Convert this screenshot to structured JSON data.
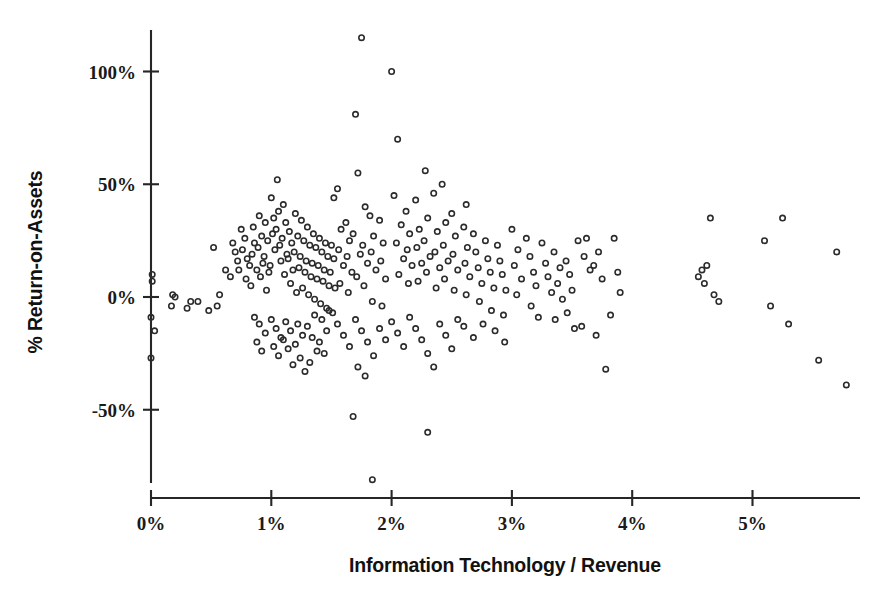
{
  "chart_data": {
    "type": "scatter",
    "title": "",
    "xlabel": "Information Technology / Revenue",
    "ylabel": "% Return-on-Assets",
    "xlim": [
      0,
      5.92
    ],
    "ylim": [
      -95,
      125
    ],
    "grid": false,
    "legend": null,
    "marker_style": "open-circle",
    "xticks": [
      0,
      1,
      2,
      3,
      4,
      5
    ],
    "xtick_labels": [
      "0%",
      "1%",
      "2%",
      "3%",
      "4%",
      "5%"
    ],
    "yticks": [
      -50,
      0,
      50,
      100
    ],
    "ytick_labels": [
      "-50%",
      "0%",
      "50%",
      "100%"
    ],
    "n_points": 268,
    "points": [
      [
        0.01,
        10
      ],
      [
        0.01,
        7
      ],
      [
        0.0,
        -9
      ],
      [
        0.0,
        -27
      ],
      [
        0.03,
        -15
      ],
      [
        0.18,
        1
      ],
      [
        0.2,
        0
      ],
      [
        0.17,
        -4
      ],
      [
        0.3,
        -5
      ],
      [
        0.33,
        -2
      ],
      [
        0.39,
        -2
      ],
      [
        0.52,
        22
      ],
      [
        0.62,
        12
      ],
      [
        0.57,
        1
      ],
      [
        0.68,
        24
      ],
      [
        0.7,
        20
      ],
      [
        0.72,
        16
      ],
      [
        0.73,
        12
      ],
      [
        0.66,
        9
      ],
      [
        0.75,
        30
      ],
      [
        0.78,
        26
      ],
      [
        0.76,
        21
      ],
      [
        0.8,
        17
      ],
      [
        0.82,
        14
      ],
      [
        0.79,
        8
      ],
      [
        0.85,
        31
      ],
      [
        0.86,
        24
      ],
      [
        0.84,
        19
      ],
      [
        0.88,
        12
      ],
      [
        0.83,
        5
      ],
      [
        0.9,
        36
      ],
      [
        0.92,
        27
      ],
      [
        0.89,
        22
      ],
      [
        0.93,
        15
      ],
      [
        0.91,
        9
      ],
      [
        0.95,
        33
      ],
      [
        0.97,
        25
      ],
      [
        0.94,
        18
      ],
      [
        0.98,
        11
      ],
      [
        0.96,
        3
      ],
      [
        1.0,
        44
      ],
      [
        1.02,
        35
      ],
      [
        1.01,
        28
      ],
      [
        1.03,
        21
      ],
      [
        0.99,
        14
      ],
      [
        1.05,
        52
      ],
      [
        1.06,
        38
      ],
      [
        1.04,
        30
      ],
      [
        1.07,
        23
      ],
      [
        1.08,
        16
      ],
      [
        1.1,
        41
      ],
      [
        1.12,
        33
      ],
      [
        1.09,
        26
      ],
      [
        1.13,
        19
      ],
      [
        1.11,
        10
      ],
      [
        1.15,
        29
      ],
      [
        1.17,
        24
      ],
      [
        1.14,
        17
      ],
      [
        1.18,
        12
      ],
      [
        1.16,
        6
      ],
      [
        1.2,
        37
      ],
      [
        1.22,
        27
      ],
      [
        1.19,
        20
      ],
      [
        1.23,
        13
      ],
      [
        1.21,
        2
      ],
      [
        1.25,
        34
      ],
      [
        1.27,
        25
      ],
      [
        1.24,
        18
      ],
      [
        1.28,
        11
      ],
      [
        1.26,
        4
      ],
      [
        1.3,
        31
      ],
      [
        1.32,
        23
      ],
      [
        1.29,
        16
      ],
      [
        1.33,
        9
      ],
      [
        1.31,
        1
      ],
      [
        1.35,
        28
      ],
      [
        1.37,
        22
      ],
      [
        1.34,
        15
      ],
      [
        1.38,
        8
      ],
      [
        1.36,
        -1
      ],
      [
        1.4,
        26
      ],
      [
        1.42,
        20
      ],
      [
        1.39,
        14
      ],
      [
        1.43,
        7
      ],
      [
        1.41,
        -3
      ],
      [
        1.45,
        24
      ],
      [
        1.47,
        18
      ],
      [
        1.44,
        12
      ],
      [
        1.48,
        5
      ],
      [
        1.46,
        -5
      ],
      [
        1.5,
        23
      ],
      [
        1.52,
        17
      ],
      [
        1.49,
        11
      ],
      [
        1.53,
        4
      ],
      [
        1.51,
        -7
      ],
      [
        0.86,
        -9
      ],
      [
        0.9,
        -12
      ],
      [
        0.95,
        -16
      ],
      [
        0.88,
        -20
      ],
      [
        0.92,
        -24
      ],
      [
        1.0,
        -10
      ],
      [
        1.04,
        -14
      ],
      [
        1.08,
        -18
      ],
      [
        1.02,
        -22
      ],
      [
        1.06,
        -26
      ],
      [
        1.12,
        -11
      ],
      [
        1.16,
        -15
      ],
      [
        1.1,
        -19
      ],
      [
        1.14,
        -23
      ],
      [
        1.18,
        -30
      ],
      [
        1.22,
        -12
      ],
      [
        1.26,
        -17
      ],
      [
        1.2,
        -21
      ],
      [
        1.24,
        -27
      ],
      [
        1.28,
        -33
      ],
      [
        1.3,
        -13
      ],
      [
        1.34,
        -18
      ],
      [
        1.38,
        -24
      ],
      [
        1.32,
        -29
      ],
      [
        1.36,
        -8
      ],
      [
        1.42,
        -10
      ],
      [
        1.46,
        -15
      ],
      [
        1.4,
        -20
      ],
      [
        1.44,
        -25
      ],
      [
        1.48,
        -6
      ],
      [
        1.55,
        48
      ],
      [
        1.58,
        30
      ],
      [
        1.56,
        21
      ],
      [
        1.6,
        14
      ],
      [
        1.57,
        6
      ],
      [
        1.62,
        33
      ],
      [
        1.65,
        25
      ],
      [
        1.63,
        18
      ],
      [
        1.67,
        11
      ],
      [
        1.64,
        2
      ],
      [
        1.7,
        81
      ],
      [
        1.72,
        55
      ],
      [
        1.68,
        28
      ],
      [
        1.74,
        19
      ],
      [
        1.71,
        9
      ],
      [
        1.75,
        115
      ],
      [
        1.78,
        40
      ],
      [
        1.76,
        23
      ],
      [
        1.8,
        15
      ],
      [
        1.77,
        5
      ],
      [
        1.82,
        36
      ],
      [
        1.85,
        27
      ],
      [
        1.83,
        20
      ],
      [
        1.87,
        12
      ],
      [
        1.84,
        -2
      ],
      [
        1.9,
        34
      ],
      [
        1.93,
        24
      ],
      [
        1.91,
        16
      ],
      [
        1.95,
        8
      ],
      [
        1.92,
        -4
      ],
      [
        1.55,
        -12
      ],
      [
        1.6,
        -17
      ],
      [
        1.65,
        -22
      ],
      [
        1.7,
        -10
      ],
      [
        1.75,
        -15
      ],
      [
        1.8,
        -20
      ],
      [
        1.85,
        -26
      ],
      [
        1.9,
        -14
      ],
      [
        1.95,
        -19
      ],
      [
        1.72,
        -31
      ],
      [
        1.78,
        -35
      ],
      [
        1.68,
        -53
      ],
      [
        1.84,
        -81
      ],
      [
        2.0,
        100
      ],
      [
        2.05,
        70
      ],
      [
        2.02,
        45
      ],
      [
        2.08,
        32
      ],
      [
        2.04,
        24
      ],
      [
        2.1,
        17
      ],
      [
        2.06,
        10
      ],
      [
        2.12,
        38
      ],
      [
        2.15,
        28
      ],
      [
        2.13,
        21
      ],
      [
        2.17,
        14
      ],
      [
        2.14,
        6
      ],
      [
        2.2,
        43
      ],
      [
        2.23,
        30
      ],
      [
        2.21,
        22
      ],
      [
        2.25,
        15
      ],
      [
        2.22,
        7
      ],
      [
        2.28,
        56
      ],
      [
        2.3,
        35
      ],
      [
        2.27,
        25
      ],
      [
        2.32,
        18
      ],
      [
        2.29,
        11
      ],
      [
        2.35,
        46
      ],
      [
        2.38,
        29
      ],
      [
        2.36,
        20
      ],
      [
        2.4,
        13
      ],
      [
        2.37,
        4
      ],
      [
        2.42,
        50
      ],
      [
        2.45,
        33
      ],
      [
        2.43,
        23
      ],
      [
        2.47,
        16
      ],
      [
        2.44,
        8
      ],
      [
        2.5,
        37
      ],
      [
        2.53,
        27
      ],
      [
        2.51,
        19
      ],
      [
        2.55,
        12
      ],
      [
        2.52,
        3
      ],
      [
        2.0,
        -11
      ],
      [
        2.05,
        -16
      ],
      [
        2.1,
        -22
      ],
      [
        2.15,
        -9
      ],
      [
        2.2,
        -14
      ],
      [
        2.25,
        -19
      ],
      [
        2.3,
        -25
      ],
      [
        2.35,
        -31
      ],
      [
        2.4,
        -12
      ],
      [
        2.45,
        -17
      ],
      [
        2.5,
        -23
      ],
      [
        2.55,
        -10
      ],
      [
        2.3,
        -60
      ],
      [
        2.6,
        31
      ],
      [
        2.63,
        22
      ],
      [
        2.61,
        15
      ],
      [
        2.65,
        9
      ],
      [
        2.62,
        1
      ],
      [
        2.68,
        28
      ],
      [
        2.7,
        20
      ],
      [
        2.72,
        13
      ],
      [
        2.75,
        6
      ],
      [
        2.73,
        -2
      ],
      [
        2.78,
        25
      ],
      [
        2.8,
        17
      ],
      [
        2.82,
        11
      ],
      [
        2.85,
        4
      ],
      [
        2.83,
        -6
      ],
      [
        2.88,
        23
      ],
      [
        2.9,
        16
      ],
      [
        2.92,
        10
      ],
      [
        2.95,
        3
      ],
      [
        2.93,
        -8
      ],
      [
        2.6,
        -13
      ],
      [
        2.68,
        -18
      ],
      [
        2.76,
        -12
      ],
      [
        2.86,
        -15
      ],
      [
        2.94,
        -20
      ],
      [
        3.0,
        30
      ],
      [
        3.05,
        21
      ],
      [
        3.02,
        14
      ],
      [
        3.08,
        8
      ],
      [
        3.04,
        1
      ],
      [
        3.12,
        26
      ],
      [
        3.15,
        18
      ],
      [
        3.18,
        11
      ],
      [
        3.2,
        5
      ],
      [
        3.16,
        -4
      ],
      [
        3.25,
        24
      ],
      [
        3.28,
        15
      ],
      [
        3.3,
        9
      ],
      [
        3.33,
        2
      ],
      [
        3.22,
        -9
      ],
      [
        3.35,
        20
      ],
      [
        3.4,
        13
      ],
      [
        3.38,
        6
      ],
      [
        3.42,
        -1
      ],
      [
        3.36,
        -10
      ],
      [
        3.45,
        16
      ],
      [
        3.48,
        10
      ],
      [
        3.5,
        3
      ],
      [
        3.46,
        -7
      ],
      [
        3.52,
        -14
      ],
      [
        3.55,
        25
      ],
      [
        3.6,
        18
      ],
      [
        3.62,
        26
      ],
      [
        3.65,
        12
      ],
      [
        3.58,
        -13
      ],
      [
        3.68,
        14
      ],
      [
        3.72,
        20
      ],
      [
        3.75,
        8
      ],
      [
        3.7,
        -17
      ],
      [
        3.78,
        -32
      ],
      [
        3.85,
        26
      ],
      [
        3.88,
        11
      ],
      [
        3.9,
        2
      ],
      [
        3.82,
        -8
      ],
      [
        4.55,
        9
      ],
      [
        4.58,
        12
      ],
      [
        4.62,
        14
      ],
      [
        4.6,
        6
      ],
      [
        4.65,
        35
      ],
      [
        4.68,
        1
      ],
      [
        4.72,
        -2
      ],
      [
        5.1,
        25
      ],
      [
        5.15,
        -4
      ],
      [
        5.25,
        35
      ],
      [
        5.3,
        -12
      ],
      [
        5.55,
        -28
      ],
      [
        5.7,
        20
      ],
      [
        5.78,
        -39
      ],
      [
        0.55,
        -4
      ],
      [
        0.48,
        -6
      ],
      [
        1.52,
        44
      ],
      [
        2.62,
        41
      ]
    ]
  },
  "axes": {
    "x_title": "Information Technology / Revenue",
    "y_title": "% Return-on-Assets",
    "x_tick_labels": [
      "0%",
      "1%",
      "2%",
      "3%",
      "4%",
      "5%"
    ],
    "y_tick_labels": [
      "100%",
      "50%",
      "0%",
      "-50%"
    ]
  },
  "colors": {
    "marker_stroke": "#2b2b2b",
    "axis": "#262626",
    "text": "#111111",
    "background": "#ffffff"
  }
}
